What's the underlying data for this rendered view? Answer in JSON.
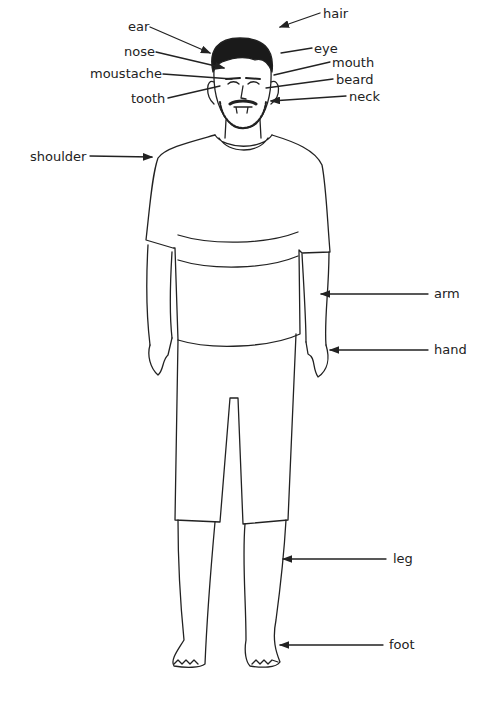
{
  "diagram": {
    "type": "labeled-illustration",
    "labels": [
      {
        "id": "ear",
        "text": "ear",
        "x": 128,
        "y": 20
      },
      {
        "id": "nose",
        "text": "nose",
        "x": 124,
        "y": 45
      },
      {
        "id": "moustache",
        "text": "moustache",
        "x": 90,
        "y": 68
      },
      {
        "id": "tooth",
        "text": "tooth",
        "x": 131,
        "y": 93
      },
      {
        "id": "shoulder",
        "text": "shoulder",
        "x": 30,
        "y": 151
      },
      {
        "id": "hair",
        "text": "hair",
        "x": 323,
        "y": 8
      },
      {
        "id": "eye",
        "text": "eye",
        "x": 314,
        "y": 43
      },
      {
        "id": "mouth",
        "text": "mouth",
        "x": 332,
        "y": 57
      },
      {
        "id": "beard",
        "text": "beard",
        "x": 336,
        "y": 74
      },
      {
        "id": "neck",
        "text": "neck",
        "x": 349,
        "y": 90
      },
      {
        "id": "arm",
        "text": "arm",
        "x": 434,
        "y": 287
      },
      {
        "id": "hand",
        "text": "hand",
        "x": 434,
        "y": 343
      },
      {
        "id": "leg",
        "text": "leg",
        "x": 393,
        "y": 554
      },
      {
        "id": "foot",
        "text": "foot",
        "x": 389,
        "y": 639
      }
    ]
  }
}
